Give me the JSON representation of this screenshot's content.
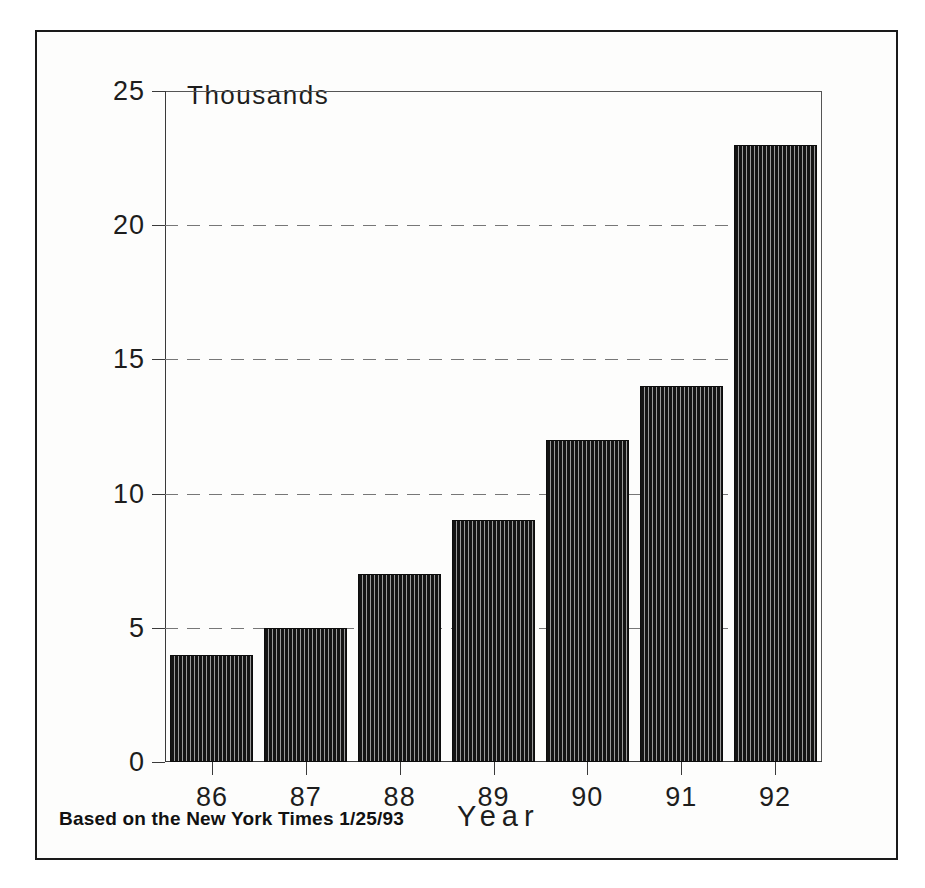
{
  "chart_data": {
    "type": "bar",
    "title": "",
    "subtitle": "",
    "categories": [
      "86",
      "87",
      "88",
      "89",
      "90",
      "91",
      "92"
    ],
    "values": [
      4,
      5,
      7,
      9,
      12,
      14,
      23
    ],
    "xlabel": "Year",
    "ylabel": "Thousands",
    "ylim": [
      0,
      25
    ],
    "yticks": [
      0,
      5,
      10,
      15,
      20,
      25
    ],
    "ytick_labels": [
      "0",
      "5",
      "10",
      "15",
      "20",
      "25"
    ],
    "grid": "horizontal-dashed",
    "legend": "none",
    "bar_fill": "vertical-pinstripe-hatch",
    "bar_color": "#151515",
    "gridline_color": "#777777",
    "axis_color": "#3a3a3a",
    "frame_color": "#1a1a1a",
    "background": "#fdfdfc",
    "annotations": [
      "Based on the New York Times 1/25/93"
    ]
  },
  "labels": {
    "y_axis_title": "Thousands",
    "x_axis_title": "Year",
    "source_note": "Based on the New York Times 1/25/93"
  }
}
